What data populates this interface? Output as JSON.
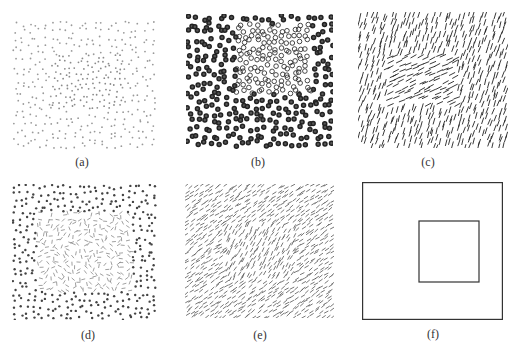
{
  "figure": {
    "panels": [
      {
        "id": "a",
        "label": "(a)",
        "kind": "dots",
        "x": 12,
        "y": 20,
        "w": 146,
        "h": 130,
        "label_x": 62,
        "label_y": 155,
        "outer": {
          "spacing": 7.2,
          "size": 0.9,
          "color": "#9a9a9a"
        },
        "inner": {
          "spacing": 5.6,
          "size": 0.9,
          "color": "#8a8a8a",
          "region": {
            "x": 40,
            "y": 35,
            "w": 70,
            "h": 55
          }
        }
      },
      {
        "id": "b",
        "label": "(b)",
        "kind": "rings",
        "x": 186,
        "y": 14,
        "w": 147,
        "h": 136,
        "label_x": 238,
        "label_y": 155,
        "outer": {
          "spacing": 7.4,
          "r": 2.0,
          "stroke": "#222222",
          "sw": 1.5,
          "fill": "#555555"
        },
        "inner": {
          "spacing": 6.2,
          "r": 2.3,
          "stroke": "#333333",
          "sw": 0.9,
          "fill": "none",
          "region": {
            "x": 50,
            "y": 10,
            "w": 75,
            "h": 70
          }
        }
      },
      {
        "id": "c",
        "label": "(c)",
        "kind": "lines",
        "x": 358,
        "y": 12,
        "w": 150,
        "h": 136,
        "label_x": 408,
        "label_y": 155,
        "outer": {
          "spacing": 6.0,
          "len": 6,
          "angle": -72,
          "jitter": 12,
          "color": "#222222",
          "sw": 0.9
        },
        "inner": {
          "spacing": 6.0,
          "len": 6,
          "angle": -25,
          "jitter": 10,
          "color": "#222222",
          "sw": 0.9,
          "region": {
            "x": 28,
            "y": 42,
            "w": 72,
            "h": 52
          }
        }
      },
      {
        "id": "d",
        "label": "(d)",
        "kind": "mixed",
        "x": 12,
        "y": 184,
        "w": 146,
        "h": 136,
        "label_x": 68,
        "label_y": 328,
        "outer": {
          "spacing": 6.3,
          "size": 1.2,
          "color": "#444444"
        },
        "inner": {
          "spacing": 5.4,
          "len": 4,
          "color": "#777777",
          "sw": 0.7,
          "region": {
            "x": 25,
            "y": 28,
            "w": 95,
            "h": 80
          }
        }
      },
      {
        "id": "e",
        "label": "(e)",
        "kind": "lines",
        "x": 185,
        "y": 184,
        "w": 149,
        "h": 134,
        "label_x": 240,
        "label_y": 328,
        "outer": {
          "spacing": 4.8,
          "len": 4,
          "angle": -35,
          "jitter": 18,
          "color": "#555555",
          "sw": 0.8
        },
        "inner": {
          "spacing": 4.8,
          "len": 4,
          "angle": -60,
          "jitter": 18,
          "color": "#555555",
          "sw": 0.8,
          "region": {
            "x": 40,
            "y": 40,
            "w": 70,
            "h": 55
          }
        }
      },
      {
        "id": "f",
        "label": "(f)",
        "kind": "squares",
        "x": 362,
        "y": 182,
        "w": 141,
        "h": 138,
        "label_x": 413,
        "label_y": 327,
        "outer_square": {
          "stroke": "#333333",
          "sw": 1.2
        },
        "inner_square": {
          "x": 57,
          "y": 39,
          "w": 60,
          "h": 61,
          "stroke": "#333333",
          "sw": 1.2
        }
      }
    ]
  }
}
